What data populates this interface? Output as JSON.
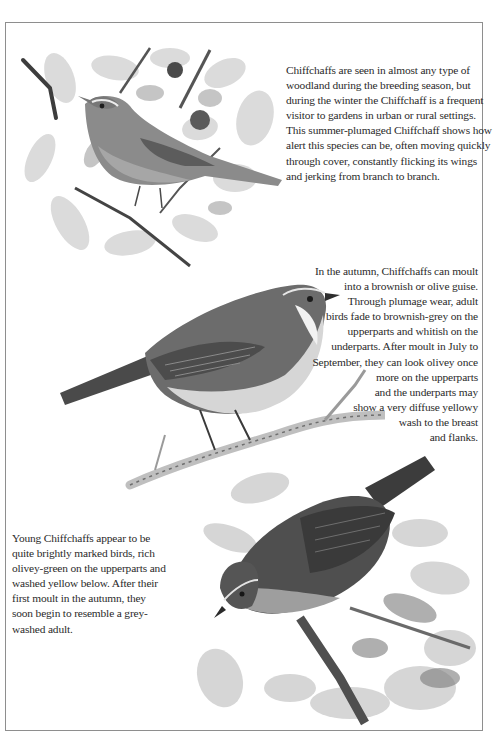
{
  "page": {
    "frame_border_color": "#8e8e8e",
    "background_color": "#ffffff",
    "text_color": "#2a2a2a"
  },
  "illustrations": [
    {
      "id": "summer-chiffchaff",
      "subject": "summer-plumaged Chiffchaff perched among leaves and twigs",
      "palette": [
        "#9a9a9a",
        "#6f6f6f",
        "#c9c9c9",
        "#3d3d3d"
      ]
    },
    {
      "id": "autumn-chiffchaff",
      "subject": "brownish-grey adult Chiffchaff perched on a pale branch",
      "palette": [
        "#5f5f5f",
        "#8a8a8a",
        "#d8d8d8",
        "#2e2e2e"
      ]
    },
    {
      "id": "young-chiffchaff",
      "subject": "young Chiffchaff peering down amid foliage",
      "palette": [
        "#4d4d4d",
        "#7a7a7a",
        "#b8b8b8",
        "#2a2a2a"
      ]
    }
  ],
  "paragraphs": {
    "summer": {
      "lines": [
        "Chiffchaffs are seen in almost any type of",
        "woodland during the breeding season, but",
        "during the winter the Chiffchaff is a frequent",
        "visitor to gardens in urban or rural settings.",
        "This summer-plumaged Chiffchaff shows how",
        "alert this species can be, often moving quickly",
        "through cover, constantly flicking its wings",
        "and jerking from branch to branch."
      ]
    },
    "autumn": {
      "lines": [
        "In the autumn, Chiffchaffs can moult",
        "into a brownish or olive guise.",
        "Through plumage wear, adult",
        "birds fade to brownish-grey on the",
        "upperparts and whitish on the",
        "underparts. After moult in July to",
        "September, they can look olivey once",
        "more on the upperparts",
        "and the underparts may",
        "show a very diffuse yellowy",
        "wash to the breast",
        "and flanks."
      ]
    },
    "young": {
      "lines": [
        "Young Chiffchaffs appear to be",
        "quite brightly marked birds, rich",
        "olivey-green on the upperparts and",
        "washed yellow below. After their",
        "first moult in the autumn, they",
        "soon begin to resemble a grey-",
        "washed adult."
      ]
    }
  }
}
